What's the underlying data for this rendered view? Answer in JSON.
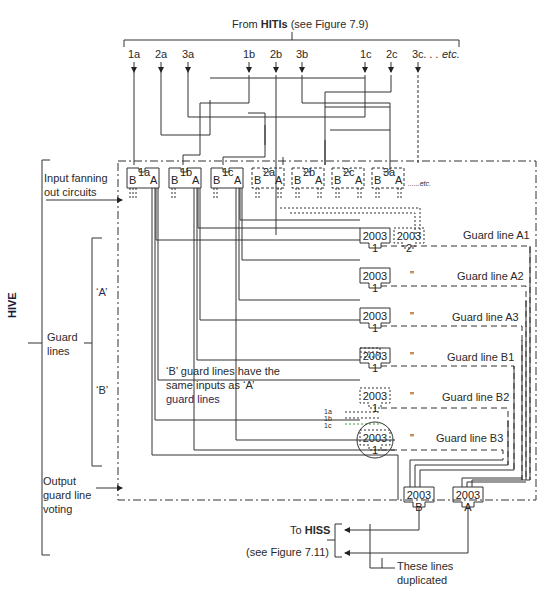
{
  "header": {
    "prefix": "From ",
    "source_bold": "HITIs",
    "suffix": " (see Figure 7.9)"
  },
  "inputs": [
    {
      "label": "1a"
    },
    {
      "label": "2a"
    },
    {
      "label": "3a"
    },
    {
      "label": "1b"
    },
    {
      "label": "2b"
    },
    {
      "label": "3b"
    },
    {
      "label": "1c"
    },
    {
      "label": "2c"
    },
    {
      "label": "3c"
    }
  ],
  "inputs_etc": ". . . etc.",
  "side_labels": {
    "hive": "HIVE",
    "input_fanning_1": "Input fanning",
    "input_fanning_2": "out circuits",
    "guard_lines_1": "Guard",
    "guard_lines_2": "lines",
    "group_a": "‘A’",
    "group_b": "‘B’",
    "output_1": "Output",
    "output_2": "guard line",
    "output_3": "voting"
  },
  "fanout_circuits": [
    {
      "id": "1a",
      "left": "B",
      "right": "A",
      "style": "solid"
    },
    {
      "id": "1b",
      "left": "B",
      "right": "A",
      "style": "solid"
    },
    {
      "id": "1c",
      "left": "B",
      "right": "A",
      "style": "solid"
    },
    {
      "id": "2a",
      "left": "B",
      "right": "A",
      "style": "dashed"
    },
    {
      "id": "2b",
      "left": "B",
      "right": "A",
      "style": "dashed"
    },
    {
      "id": "2c",
      "left": "B",
      "right": "A",
      "style": "dashed"
    },
    {
      "id": "3a",
      "left": "B",
      "right": "A",
      "style": "dashed"
    }
  ],
  "fanout_etc": "......etc.",
  "voting_gates": [
    {
      "top": "2003",
      "bottom": "1",
      "guard_line": "Guard line A1",
      "ditto": ""
    },
    {
      "top": "2003",
      "bottom": "2",
      "guard_line": "",
      "ditto": ""
    },
    {
      "top": "2003",
      "bottom": "1",
      "guard_line": "Guard line A2",
      "ditto": "\""
    },
    {
      "top": "2003",
      "bottom": "1",
      "guard_line": "Guard line A3",
      "ditto": "\""
    },
    {
      "top": "2003",
      "bottom": "1",
      "guard_line": "Guard line B1",
      "ditto": "\""
    },
    {
      "top": "2003",
      "bottom": "1",
      "guard_line": "Guard line B2",
      "ditto": "\""
    },
    {
      "top": "2003",
      "bottom": "1",
      "guard_line": "Guard line B3",
      "ditto": "\""
    }
  ],
  "b_inputs": [
    "1a",
    "1b",
    "1c"
  ],
  "note": {
    "line1": "‘B’ guard lines have the",
    "line2": "same inputs as ‘A’",
    "line3": "guard lines"
  },
  "output_gates": [
    {
      "top": "2003",
      "bottom": "B"
    },
    {
      "top": "2003",
      "bottom": "A"
    }
  ],
  "footer": {
    "to_prefix": "To ",
    "to_bold": "HISS",
    "see": "(see Figure 7.11)",
    "dup_1": "These lines",
    "dup_2": "duplicated"
  }
}
